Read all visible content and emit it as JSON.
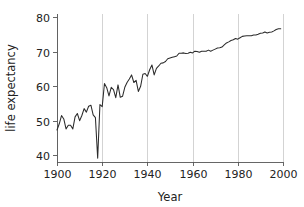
{
  "chart_data": {
    "type": "line",
    "title": "",
    "xlabel": "Year",
    "ylabel": "life expectancy",
    "xlim": [
      1900,
      2000
    ],
    "ylim": [
      38,
      81
    ],
    "xticks": [
      1900,
      1920,
      1940,
      1960,
      1980,
      2000
    ],
    "yticks": [
      40,
      50,
      60,
      70,
      80
    ],
    "xtick_labels": [
      "1900",
      "1920",
      "1940",
      "1960",
      "1980",
      "2000"
    ],
    "ytick_labels": [
      "40",
      "50",
      "60",
      "70",
      "80"
    ],
    "grid": "vertical-only",
    "legend": "none",
    "line_color": "#2b2b2b",
    "grid_color": "#c8c8c8",
    "axis_color": "#555555",
    "background_color": "#ffffff",
    "series": [
      {
        "name": "life expectancy",
        "x": [
          1900,
          1901,
          1902,
          1903,
          1904,
          1905,
          1906,
          1907,
          1908,
          1909,
          1910,
          1911,
          1912,
          1913,
          1914,
          1915,
          1916,
          1917,
          1918,
          1919,
          1920,
          1921,
          1922,
          1923,
          1924,
          1925,
          1926,
          1927,
          1928,
          1929,
          1930,
          1931,
          1932,
          1933,
          1934,
          1935,
          1936,
          1937,
          1938,
          1939,
          1940,
          1941,
          1942,
          1943,
          1944,
          1945,
          1946,
          1947,
          1948,
          1949,
          1950,
          1951,
          1952,
          1953,
          1954,
          1955,
          1956,
          1957,
          1958,
          1959,
          1960,
          1961,
          1962,
          1963,
          1964,
          1965,
          1966,
          1967,
          1968,
          1969,
          1970,
          1971,
          1972,
          1973,
          1974,
          1975,
          1976,
          1977,
          1978,
          1979,
          1980,
          1981,
          1982,
          1983,
          1984,
          1985,
          1986,
          1987,
          1988,
          1989,
          1990,
          1991,
          1992,
          1993,
          1994,
          1995,
          1996,
          1997,
          1998,
          1999
        ],
        "values": [
          47.3,
          49.1,
          51.5,
          50.5,
          47.6,
          48.7,
          48.7,
          47.6,
          51.1,
          52.1,
          50.0,
          51.5,
          53.5,
          52.5,
          54.2,
          54.5,
          51.7,
          50.9,
          39.1,
          54.7,
          54.1,
          60.8,
          59.6,
          57.2,
          59.7,
          59.0,
          56.7,
          60.4,
          56.8,
          57.1,
          59.7,
          61.1,
          62.1,
          63.3,
          61.1,
          61.7,
          58.5,
          60.0,
          63.5,
          63.7,
          62.9,
          64.8,
          66.2,
          63.3,
          65.2,
          65.9,
          66.7,
          66.8,
          67.2,
          68.0,
          68.2,
          68.4,
          68.6,
          68.8,
          69.6,
          69.6,
          69.7,
          69.5,
          69.6,
          69.9,
          69.7,
          70.2,
          70.1,
          69.9,
          70.2,
          70.2,
          70.2,
          70.5,
          70.2,
          70.5,
          70.8,
          71.1,
          71.2,
          71.4,
          72.0,
          72.6,
          72.9,
          73.3,
          73.5,
          73.9,
          73.7,
          74.1,
          74.5,
          74.6,
          74.7,
          74.7,
          74.7,
          74.9,
          74.9,
          75.1,
          75.4,
          75.5,
          75.8,
          75.5,
          75.7,
          75.8,
          76.1,
          76.5,
          76.7,
          76.7
        ]
      }
    ]
  }
}
